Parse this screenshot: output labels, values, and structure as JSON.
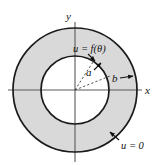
{
  "figure": {
    "name": "annulus-boundary-value-diagram",
    "background_color": "#ffffff",
    "axes": {
      "x_label": "x",
      "y_label": "y",
      "axis_color": "#5a5a5a",
      "origin": {
        "x": 75,
        "y": 90
      }
    },
    "regions": {
      "annulus_fill": "#d9d9d9",
      "inner_disk_fill": "#ffffff",
      "stroke_color": "#1a1a1a",
      "outer_radius_px": 62,
      "inner_radius_px": 34
    },
    "labels": {
      "inner_boundary_condition": "u = f(θ)",
      "outer_boundary_condition": "u = 0",
      "inner_radius": "a",
      "outer_radius": "b"
    },
    "leader_lines": {
      "inner_boundary_arrow": "arrow from u = f(theta) label down-right to inner circle",
      "outer_boundary_arrow": "arrow from u = 0 label up-left to outer circle",
      "radius_a_dashes": "dashed segment from origin up-right to inner circle",
      "radius_b_dashes": "dashed segment from origin right-up to outer circle",
      "dash_color": "#3a3a3a"
    }
  }
}
